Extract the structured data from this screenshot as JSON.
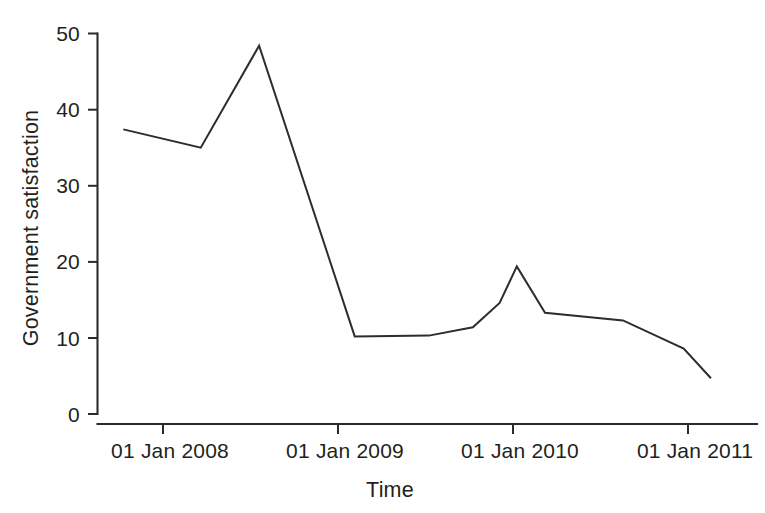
{
  "chart_data": {
    "type": "line",
    "title": "",
    "subtitle": "",
    "xlabel": "Time",
    "ylabel": "Government satisfaction",
    "grid": false,
    "legend": false,
    "legend_position": "none",
    "line_color": "#302c2d",
    "axis_color": "#2b2b2b",
    "background_color": "#ffffff",
    "x_type": "date",
    "xlim": [
      "2007-09-01",
      "2011-03-01"
    ],
    "ylim": [
      0,
      50
    ],
    "yticks": [
      0,
      10,
      20,
      30,
      40,
      50
    ],
    "ytick_labels": [
      "0",
      "10",
      "20",
      "30",
      "40",
      "50"
    ],
    "xticks": [
      "2008-01-01",
      "2009-01-01",
      "2010-01-01",
      "2011-01-01"
    ],
    "xtick_labels": [
      "01 Jan 2008",
      "01 Jan 2009",
      "01 Jan 2010",
      "01 Jan 2011"
    ],
    "series": [
      {
        "name": "Government satisfaction",
        "x": [
          "2007-10-10",
          "2008-03-20",
          "2008-07-20",
          "2009-02-05",
          "2009-07-10",
          "2009-10-10",
          "2009-12-05",
          "2010-01-10",
          "2010-03-10",
          "2010-08-20",
          "2010-12-25",
          "2011-02-20"
        ],
        "values": [
          37.4,
          35.0,
          48.4,
          10.2,
          10.3,
          11.4,
          14.6,
          19.4,
          13.3,
          12.3,
          8.6,
          4.7
        ]
      }
    ]
  },
  "axes": {
    "y_title": "Government satisfaction",
    "x_title": "Time"
  }
}
